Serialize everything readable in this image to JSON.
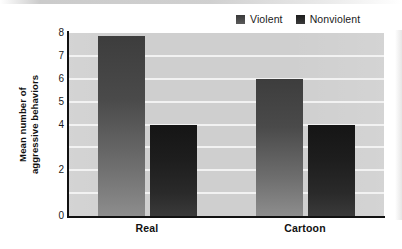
{
  "chart_data": {
    "type": "bar",
    "title": "",
    "xlabel": "",
    "ylabel": "Mean number of aggressive behaviors",
    "ylabel_line1": "Mean number of",
    "ylabel_line2": "aggressive behaviors",
    "categories": [
      "Real",
      "Cartoon"
    ],
    "series": [
      {
        "name": "Violent",
        "values": [
          7.85,
          6.0
        ],
        "color": "#4a4a4a"
      },
      {
        "name": "Nonviolent",
        "values": [
          4.0,
          4.0
        ],
        "color": "#1e1e1e"
      }
    ],
    "ylim": [
      0,
      8
    ],
    "ytick_values": [
      8,
      7,
      6,
      5,
      4,
      2,
      0
    ],
    "ytick_labels": [
      "8",
      "7",
      "6",
      "5",
      "4",
      "2",
      "0"
    ],
    "gridlines": true,
    "grid_color": "#f2f2f2",
    "plot_background": "#cfcfcf",
    "legend_position": "top-right"
  },
  "legend": {
    "items": [
      {
        "label": "Violent",
        "swatch": "violent-swatch"
      },
      {
        "label": "Nonviolent",
        "swatch": "nonviolent-swatch"
      }
    ]
  }
}
